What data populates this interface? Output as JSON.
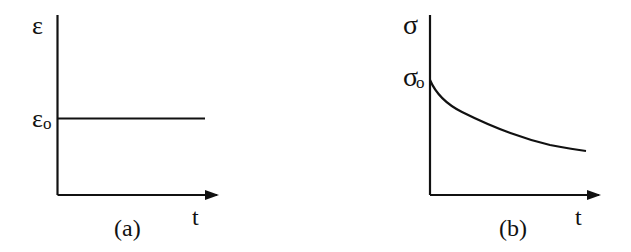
{
  "colors": {
    "stroke": "#111111",
    "background": "#ffffff"
  },
  "panels": [
    {
      "id": "a",
      "caption": "(a)",
      "y_axis_label": "ε",
      "y_level_label": "ε",
      "y_level_subscript": "o",
      "x_axis_label": "t",
      "curve": "constant strain ε₀ over time"
    },
    {
      "id": "b",
      "caption": "(b)",
      "y_axis_label": "σ",
      "y_level_label": "σ",
      "y_level_subscript": "o",
      "x_axis_label": "t",
      "curve": "stress decaying from σ₀ over time (relaxation)"
    }
  ]
}
